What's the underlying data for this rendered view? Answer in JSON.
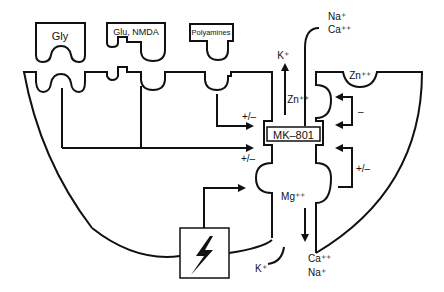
{
  "ligands": {
    "gly": "Gly",
    "glu": "Glu, NMDA",
    "polyamines": "Polyamines"
  },
  "ions": {
    "na_top": "Na⁺",
    "ca_top": "Ca⁺⁺",
    "k_top": "K⁺",
    "zn_channel": "Zn⁺⁺",
    "zn_site": "Zn⁺⁺",
    "mg": "Mg⁺⁺",
    "ca_bottom": "Ca⁺⁺",
    "na_bottom": "Na⁺",
    "k_bottom": "K⁺"
  },
  "blocker": "MK–801",
  "modulation": {
    "polyamine_effect": "+/–",
    "gly_glu_effect": "+/–",
    "zn_effect": "–",
    "mg_effect": "+/–"
  },
  "voltage_icon": "lightning-bolt-icon"
}
